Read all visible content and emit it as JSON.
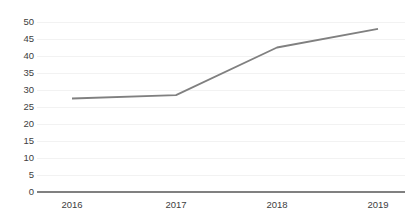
{
  "chart_data": {
    "type": "line",
    "title": "",
    "subtitle": "",
    "xlabel": "",
    "ylabel": "",
    "categories": [
      "2016",
      "2017",
      "2018",
      "2019"
    ],
    "values": [
      27.5,
      28.5,
      42.5,
      48
    ],
    "series": [
      {
        "name": "",
        "values": [
          27.5,
          28.5,
          42.5,
          48
        ]
      }
    ],
    "ylim": [
      0,
      50
    ],
    "yticks": [
      0,
      5,
      10,
      15,
      20,
      25,
      30,
      35,
      40,
      45,
      50
    ],
    "ytick_labels": [
      "0",
      "5",
      "10",
      "15",
      "20",
      "25",
      "30",
      "35",
      "40",
      "45",
      "50"
    ],
    "xtick_labels": [
      "2016",
      "2017",
      "2018",
      "2019"
    ],
    "grid": true,
    "grid_axis": "y",
    "legend": false,
    "legend_position": "none",
    "annotations": []
  },
  "style": {
    "line_color": "#808080",
    "grid_color": "#f2f2f2",
    "axis_color": "#808080",
    "tick_text_color": "#404040",
    "background_color": "#ffffff",
    "line_width": 1.8
  },
  "geometry": {
    "plot_left": 37,
    "plot_right": 405,
    "plot_top": 22,
    "plot_bottom": 192,
    "x_positions": [
      72,
      176,
      277,
      378
    ],
    "y_value_top": 50,
    "y_value_bottom": 0
  }
}
